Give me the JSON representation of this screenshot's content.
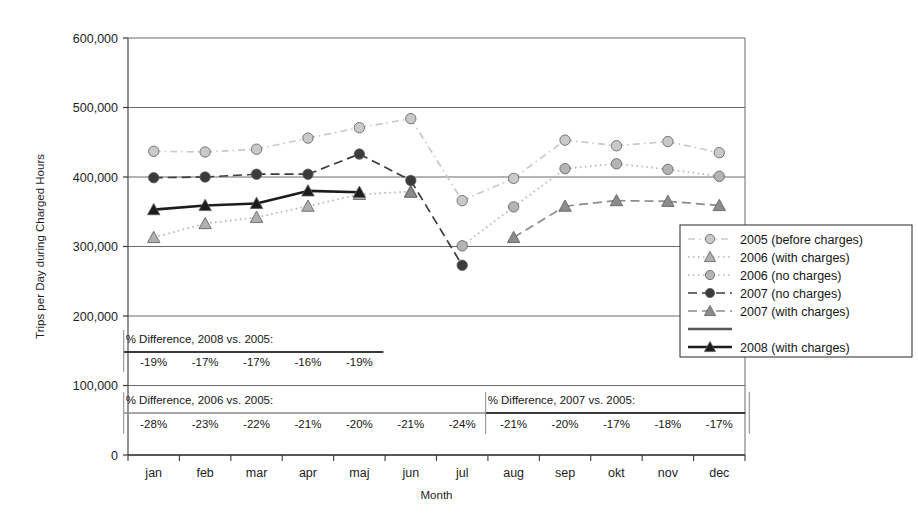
{
  "chart_data": {
    "type": "line",
    "title": "",
    "xlabel": "Month",
    "ylabel": "Trips per Day during Charged Hours",
    "categories": [
      "jan",
      "feb",
      "mar",
      "apr",
      "maj",
      "jun",
      "jul",
      "aug",
      "sep",
      "okt",
      "nov",
      "dec"
    ],
    "ylim": [
      0,
      600000
    ],
    "ytick_labels": [
      "0",
      "100,000",
      "200,000",
      "300,000",
      "400,000",
      "500,000",
      "600,000"
    ],
    "ytick_values": [
      0,
      100000,
      200000,
      300000,
      400000,
      500000,
      600000
    ],
    "grid": true,
    "legend_position": "right-inside-lower",
    "series": [
      {
        "name": "2005 (before charges)",
        "marker": "circle",
        "color": "#c9c9c9",
        "line_style": "dash-dot",
        "values": [
          437000,
          436000,
          440000,
          456000,
          471000,
          484000,
          366000,
          398000,
          453000,
          445000,
          451000,
          435000
        ]
      },
      {
        "name": "2006 (with charges)",
        "marker": "triangle",
        "color": "#b0b0b0",
        "line_style": "dotted",
        "values": [
          313000,
          333000,
          342000,
          358000,
          375000,
          379000,
          null,
          null,
          null,
          null,
          null,
          null
        ]
      },
      {
        "name": "2006 (no charges)",
        "marker": "circle",
        "color": "#b4b4b4",
        "line_style": "dotted",
        "values": [
          null,
          null,
          null,
          null,
          null,
          null,
          301000,
          357000,
          412000,
          419000,
          411000,
          401000
        ]
      },
      {
        "name": "2007 (no charges)",
        "marker": "circle",
        "color": "#3b3b3b",
        "line_style": "dashed",
        "values": [
          399000,
          400000,
          404000,
          404000,
          433000,
          395000,
          273000,
          null,
          null,
          null,
          null,
          null
        ]
      },
      {
        "name": "2007 (with charges)",
        "marker": "triangle",
        "color": "#8c8c8c",
        "line_style": "dashed",
        "values": [
          null,
          null,
          null,
          null,
          null,
          378000,
          null,
          313000,
          358000,
          366000,
          365000,
          359000
        ]
      },
      {
        "name": "2008 (with charges)",
        "marker": "triangle",
        "color": "#1c1c1c",
        "line_style": "solid",
        "values": [
          353000,
          359000,
          362000,
          380000,
          378000,
          null,
          null,
          null,
          null,
          null,
          null,
          null
        ]
      }
    ],
    "annotations": [
      {
        "id": "diff-2008-vs-2005",
        "title": "% Difference, 2008 vs. 2005:",
        "values": [
          "-19%",
          "-17%",
          "-17%",
          "-16%",
          "-19%"
        ],
        "months": [
          "jan",
          "feb",
          "mar",
          "apr",
          "maj"
        ]
      },
      {
        "id": "diff-2006-vs-2005",
        "title": "% Difference, 2006 vs. 2005:",
        "values": [
          "-28%",
          "-23%",
          "-22%",
          "-21%",
          "-20%",
          "-21%",
          "-24%"
        ],
        "months": [
          "jan",
          "feb",
          "mar",
          "apr",
          "maj",
          "jun",
          "jul"
        ]
      },
      {
        "id": "diff-2007-vs-2005",
        "title": "% Difference, 2007 vs. 2005:",
        "values": [
          "-21%",
          "-20%",
          "-17%",
          "-18%",
          "-17%"
        ],
        "months": [
          "aug",
          "sep",
          "okt",
          "nov",
          "dec"
        ]
      }
    ]
  },
  "axes": {
    "y_title": "Trips per Day during Charged Hours",
    "x_title": "Month",
    "y_ticks": [
      "600,000",
      "500,000",
      "400,000",
      "300,000",
      "200,000",
      "100,000",
      "0"
    ],
    "x_ticks": [
      "jan",
      "feb",
      "mar",
      "apr",
      "maj",
      "jun",
      "jul",
      "aug",
      "sep",
      "okt",
      "nov",
      "dec"
    ]
  },
  "legend": {
    "items": [
      {
        "label": "2005 (before charges)",
        "marker": "circle",
        "color": "#c9c9c9",
        "line_style": "dash-dot"
      },
      {
        "label": "2006 (with charges)",
        "marker": "triangle",
        "color": "#b0b0b0",
        "line_style": "dotted"
      },
      {
        "label": "2006 (no charges)",
        "marker": "circle",
        "color": "#b4b4b4",
        "line_style": "dotted"
      },
      {
        "label": "2007 (no charges)",
        "marker": "circle",
        "color": "#3b3b3b",
        "line_style": "dashed"
      },
      {
        "label": "2007 (with charges)",
        "marker": "triangle",
        "color": "#8c8c8c",
        "line_style": "dashed"
      },
      {
        "label": "",
        "marker": "none",
        "color": "#555555",
        "line_style": "solid"
      },
      {
        "label": "2008 (with charges)",
        "marker": "triangle",
        "color": "#1c1c1c",
        "line_style": "solid"
      }
    ]
  }
}
